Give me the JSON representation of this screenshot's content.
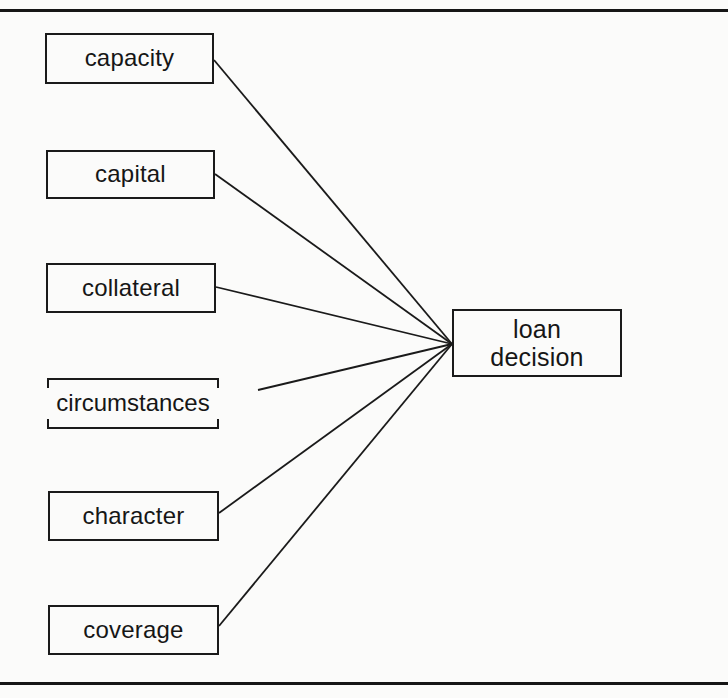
{
  "diagram": {
    "type": "fan-in influence diagram",
    "factors": [
      {
        "id": "capacity",
        "label": "capacity"
      },
      {
        "id": "capital",
        "label": "capital"
      },
      {
        "id": "collateral",
        "label": "collateral"
      },
      {
        "id": "circumstances",
        "label": "circumstances"
      },
      {
        "id": "character",
        "label": "character"
      },
      {
        "id": "coverage",
        "label": "coverage"
      }
    ],
    "target": {
      "line1": "loan",
      "line2": "decision"
    },
    "edges": [
      {
        "from": "capacity",
        "to": "loan decision"
      },
      {
        "from": "capital",
        "to": "loan decision"
      },
      {
        "from": "collateral",
        "to": "loan decision"
      },
      {
        "from": "circumstances",
        "to": "loan decision"
      },
      {
        "from": "character",
        "to": "loan decision"
      },
      {
        "from": "coverage",
        "to": "loan decision"
      }
    ]
  },
  "colors": {
    "ink": "#161616",
    "paper": "#fbfbfa"
  }
}
